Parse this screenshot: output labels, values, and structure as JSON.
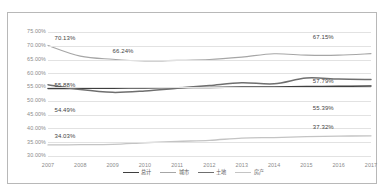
{
  "chart_data": {
    "type": "line",
    "title": "",
    "xlabel": "",
    "ylabel": "",
    "categories": [
      "2007",
      "2008",
      "2009",
      "2010",
      "2011",
      "2012",
      "2013",
      "2014",
      "2015",
      "2016",
      "2017"
    ],
    "ylim": [
      30,
      75
    ],
    "ytick_labels": [
      "75.00%",
      "70.00%",
      "65.00%",
      "60.00%",
      "55.00%",
      "50.00%",
      "45.00%",
      "40.00%",
      "35.00%",
      "30.00%"
    ],
    "ytick_values": [
      75,
      70,
      65,
      60,
      55,
      50,
      45,
      40,
      35,
      30
    ],
    "grid": true,
    "legend_position": "bottom",
    "series": [
      {
        "name": "总计",
        "color": "#3f3f3f",
        "width": 1.5,
        "values": [
          54.49,
          54.55,
          54.6,
          54.72,
          54.8,
          54.9,
          55.0,
          55.05,
          55.2,
          55.3,
          55.39
        ]
      },
      {
        "name": "城市",
        "color": "#a6a6a6",
        "width": 1.1,
        "values": [
          70.13,
          66.24,
          65.1,
          64.5,
          64.7,
          65.0,
          65.9,
          67.1,
          66.6,
          66.6,
          67.15
        ]
      },
      {
        "name": "土地",
        "color": "#6f6f6f",
        "width": 1.5,
        "values": [
          55.88,
          54.1,
          53.1,
          53.6,
          54.6,
          55.6,
          56.6,
          56.2,
          58.3,
          57.9,
          57.79
        ]
      },
      {
        "name": "房产",
        "color": "#c4c4c4",
        "width": 1.3,
        "values": [
          34.03,
          34.1,
          34.2,
          34.8,
          35.3,
          35.7,
          36.5,
          36.7,
          37.0,
          37.2,
          37.32
        ]
      }
    ],
    "annotations": [
      {
        "text": "70.13%",
        "series": "城市",
        "point_index": 0,
        "x_pct": 2.0,
        "y_px": 3,
        "align": "left"
      },
      {
        "text": "66.24%",
        "series": "城市",
        "point_index": 1,
        "x_pct": 20.0,
        "y_px": 16,
        "align": "left"
      },
      {
        "text": "67.15%",
        "series": "城市",
        "point_index": 10,
        "x_pct": 82.0,
        "y_px": 2,
        "align": "left"
      },
      {
        "text": "55.88%",
        "series": "土地",
        "point_index": 0,
        "x_pct": 2.0,
        "y_px": 50,
        "align": "left"
      },
      {
        "text": "57.79%",
        "series": "土地",
        "point_index": 10,
        "x_pct": 82.0,
        "y_px": 46,
        "align": "left"
      },
      {
        "text": "54.49%",
        "series": "总计",
        "point_index": 0,
        "x_pct": 2.0,
        "y_px": 75,
        "align": "left"
      },
      {
        "text": "55.39%",
        "series": "总计",
        "point_index": 10,
        "x_pct": 82.0,
        "y_px": 73,
        "align": "left"
      },
      {
        "text": "34.03%",
        "series": "房产",
        "point_index": 0,
        "x_pct": 2.0,
        "y_px": 101,
        "align": "left"
      },
      {
        "text": "37.32%",
        "series": "房产",
        "point_index": 10,
        "x_pct": 82.0,
        "y_px": 92,
        "align": "left"
      }
    ]
  }
}
